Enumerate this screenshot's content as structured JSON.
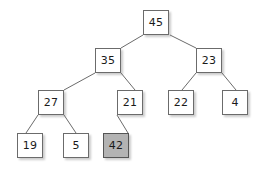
{
  "figure": {
    "kind": "binary-tree-diagram",
    "background": "#ffffff",
    "node_fill": "#ffffff",
    "node_highlight_fill": "#b3b3b3",
    "node_border": "#6b6b6b",
    "edge_color": "#6b6b6b",
    "text_color": "#1a1a1a"
  },
  "nodes": [
    {
      "id": "n45",
      "label": "45",
      "x": 143,
      "y": 10,
      "highlight": false
    },
    {
      "id": "n35",
      "label": "35",
      "x": 95,
      "y": 48,
      "highlight": false
    },
    {
      "id": "n23",
      "label": "23",
      "x": 196,
      "y": 48,
      "highlight": false
    },
    {
      "id": "n27",
      "label": "27",
      "x": 38,
      "y": 90,
      "highlight": false
    },
    {
      "id": "n21",
      "label": "21",
      "x": 117,
      "y": 90,
      "highlight": false
    },
    {
      "id": "n22",
      "label": "22",
      "x": 168,
      "y": 90,
      "highlight": false
    },
    {
      "id": "n4",
      "label": "4",
      "x": 222,
      "y": 90,
      "highlight": false
    },
    {
      "id": "n19",
      "label": "19",
      "x": 17,
      "y": 133,
      "highlight": false
    },
    {
      "id": "n5",
      "label": "5",
      "x": 63,
      "y": 133,
      "highlight": false
    },
    {
      "id": "n42",
      "label": "42",
      "x": 103,
      "y": 133,
      "highlight": true
    }
  ],
  "edges": [
    {
      "from": "n45",
      "to": "n35",
      "x1": 143,
      "y1": 35,
      "x2": 121,
      "y2": 48
    },
    {
      "from": "n45",
      "to": "n23",
      "x1": 170,
      "y1": 35,
      "x2": 196,
      "y2": 48
    },
    {
      "from": "n35",
      "to": "n27",
      "x1": 95,
      "y1": 73,
      "x2": 64,
      "y2": 90
    },
    {
      "from": "n35",
      "to": "n21",
      "x1": 121,
      "y1": 73,
      "x2": 135,
      "y2": 90
    },
    {
      "from": "n23",
      "to": "n22",
      "x1": 196,
      "y1": 73,
      "x2": 182,
      "y2": 90
    },
    {
      "from": "n23",
      "to": "n4",
      "x1": 222,
      "y1": 73,
      "x2": 236,
      "y2": 90
    },
    {
      "from": "n27",
      "to": "n19",
      "x1": 38,
      "y1": 115,
      "x2": 26,
      "y2": 133
    },
    {
      "from": "n27",
      "to": "n5",
      "x1": 64,
      "y1": 115,
      "x2": 76,
      "y2": 133
    },
    {
      "from": "n21",
      "to": "n42",
      "x1": 117,
      "y1": 115,
      "x2": 128,
      "y2": 133
    }
  ]
}
